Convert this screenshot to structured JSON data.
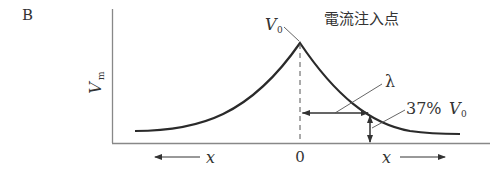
{
  "panel_label": "B",
  "y_axis_label": "V",
  "y_axis_label_sub": "m",
  "peak_label": "V",
  "peak_label_sub": "0",
  "injection_label": "電流注入点",
  "lambda_label": "λ",
  "decay_label_prefix": "37%",
  "decay_label_v": "V",
  "decay_label_sub": "0",
  "origin_label": "0",
  "x_left_label": "x",
  "x_right_label": "x",
  "colors": {
    "line": "#333333",
    "axis": "#777777"
  }
}
